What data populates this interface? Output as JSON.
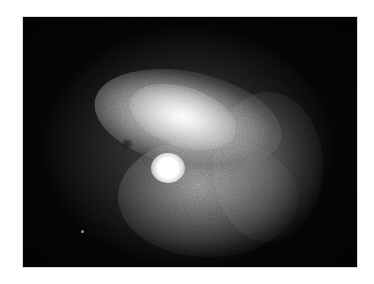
{
  "image": {
    "subject": "grayscale astronomical image of a diffuse nebula with a bright compact core",
    "alt": "Diffuse glowing nebula with a bright white core on a black background",
    "colors": {
      "page_background": "#ffffff",
      "frame_background": "#050505",
      "nebula_mid": "#9a9a9a",
      "core": "#ffffff"
    }
  }
}
